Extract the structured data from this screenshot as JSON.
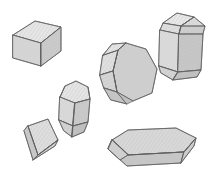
{
  "figure": {
    "background_color": "#ffffff",
    "outline_color": "#5d5d5d",
    "hatch_color": "#b9b9b9",
    "crystal_count": 6
  },
  "palette": {
    "face_light": "#e3e3e3",
    "face_mid": "#d2d2d2",
    "face_dark": "#c2c2c2",
    "face_darker": "#b4b4b4",
    "face_pale": "#ececec"
  },
  "crystals": [
    {
      "id": "crystal-cube",
      "label": "Cube (isometric habit)",
      "position": "top-left",
      "faces_visible": 3,
      "center": [
        42,
        38
      ]
    },
    {
      "id": "crystal-hexagonal-prism-tall",
      "label": "Tall hexagonal prism with beveled terminations",
      "position": "top-right",
      "faces_visible": 8,
      "center": [
        178,
        45
      ]
    },
    {
      "id": "crystal-octahedral-block",
      "label": "Stubby octagonal prism, near end-on view",
      "position": "center-right",
      "faces_visible": 7,
      "center": [
        128,
        74
      ]
    },
    {
      "id": "crystal-short-prism",
      "label": "Short prism with domed top and pointed base",
      "position": "center-left",
      "faces_visible": 8,
      "center": [
        74,
        108
      ]
    },
    {
      "id": "crystal-tabular-rhomb",
      "label": "Thin tabular rhombic plate",
      "position": "bottom-left",
      "faces_visible": 3,
      "center": [
        42,
        141
      ]
    },
    {
      "id": "crystal-tabular-elongated",
      "label": "Flat elongated hexagonal tabular crystal",
      "position": "bottom-right",
      "faces_visible": 6,
      "center": [
        150,
        148
      ]
    }
  ]
}
